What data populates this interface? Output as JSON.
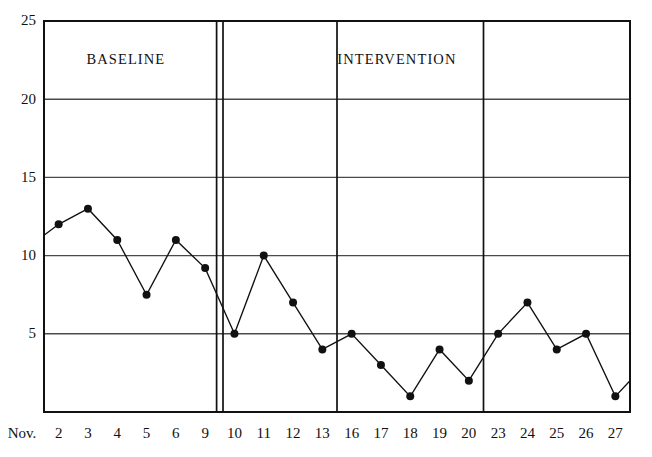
{
  "chart_data": {
    "type": "line",
    "title": "",
    "subtitle": "",
    "xlabel": "",
    "ylabel": "",
    "x_prefix": "Nov.",
    "categories": [
      "2",
      "3",
      "4",
      "5",
      "6",
      "9",
      "10",
      "11",
      "12",
      "13",
      "16",
      "17",
      "18",
      "19",
      "20",
      "23",
      "24",
      "25",
      "26",
      "27"
    ],
    "values": [
      12,
      13,
      11,
      7.5,
      11,
      9.2,
      5,
      10,
      7,
      4,
      5,
      3,
      1,
      4,
      2,
      5,
      7,
      4,
      5,
      1
    ],
    "lead_in_value": 11.3,
    "lead_out_value": 2,
    "ylim": [
      0,
      25
    ],
    "yticks": [
      "5",
      "10",
      "15",
      "20",
      "25"
    ],
    "ytick_values": [
      5,
      10,
      15,
      20,
      25
    ],
    "grid": "horizontal",
    "legend": "none",
    "marker": "filled-circle",
    "line_color": "#111111",
    "marker_color": "#111111",
    "grid_color": "#4a4a4a",
    "frame_color": "#111111",
    "phases": [
      {
        "name": "baseline",
        "label": "BASELINE",
        "start_index": 0,
        "end_index": 5
      },
      {
        "name": "intervention",
        "label": "INTERVENTION",
        "start_index": 6,
        "end_index": 19
      }
    ],
    "annotations": [
      {
        "name": "phase-divider-double",
        "type": "double-vertical-line",
        "after_category": "9"
      },
      {
        "name": "phase-divider-week-1",
        "type": "vertical-line",
        "after_category": "13"
      },
      {
        "name": "phase-divider-week-2",
        "type": "vertical-line",
        "after_category": "20"
      }
    ]
  },
  "labels": {
    "baseline": "BASELINE",
    "intervention": "INTERVENTION"
  }
}
